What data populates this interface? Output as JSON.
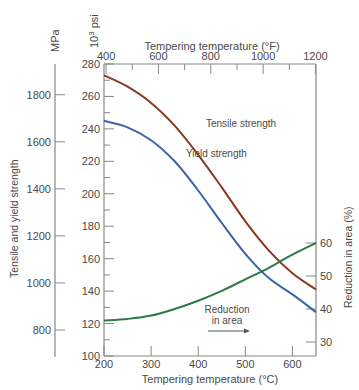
{
  "chart_data": {
    "type": "line",
    "title": "",
    "xlabel": "Tempering temperature (°C)",
    "xlabel_top": "Tempering temperature (°F)",
    "ylabel_left_outer": "Tensile and yield strength",
    "ylabel_left_outer_unit": "MPa",
    "ylabel_left_inner_unit": "10³ psi",
    "ylabel_right": "Reduction in area (%)",
    "xlim": [
      200,
      650
    ],
    "ylim_psi": [
      100,
      280
    ],
    "ylim_mpa": [
      700,
      1900
    ],
    "x_ticks_c": [
      200,
      300,
      400,
      500,
      600
    ],
    "x_ticks_f": [
      400,
      600,
      800,
      1000,
      1200
    ],
    "y_ticks_psi": [
      100,
      120,
      140,
      160,
      180,
      200,
      220,
      240,
      260,
      280
    ],
    "y_ticks_mpa": [
      800,
      1000,
      1200,
      1400,
      1600,
      1800
    ],
    "y_ticks_reduction": [
      30,
      40,
      50,
      60
    ],
    "grid": false,
    "series": [
      {
        "name": "Tensile strength",
        "axis": "psi",
        "color": "#8b3a1e",
        "x": [
          200,
          250,
          300,
          350,
          400,
          450,
          500,
          550,
          600,
          650
        ],
        "values": [
          273,
          266,
          256,
          242,
          224,
          204,
          183,
          165,
          151,
          141
        ]
      },
      {
        "name": "Yield strength",
        "axis": "psi",
        "color": "#3a64a8",
        "x": [
          200,
          250,
          300,
          350,
          400,
          450,
          500,
          550,
          600,
          650
        ],
        "values": [
          245,
          241,
          233,
          220,
          202,
          182,
          163,
          148,
          138,
          127
        ]
      },
      {
        "name": "Reduction in area",
        "axis": "reduction",
        "color": "#2e7a45",
        "x": [
          200,
          250,
          300,
          350,
          400,
          450,
          500,
          550,
          600,
          650
        ],
        "values": [
          36.5,
          37,
          38,
          40,
          42.5,
          45.5,
          49,
          52.5,
          56.5,
          60
        ]
      }
    ],
    "annotations": [
      {
        "text": "Tensile strength",
        "x_c": 420,
        "y_psi": 249
      },
      {
        "text": "Yield strength",
        "x_c": 380,
        "y_psi": 229
      },
      {
        "text": "Reduction",
        "x_c": 455,
        "y_psi": 124
      },
      {
        "text": "in area",
        "x_c": 455,
        "y_psi": 117
      },
      {
        "text": "arrow-right",
        "x_c": 430,
        "y_psi": 111
      }
    ]
  },
  "labels": {
    "mpa": "MPa",
    "psi_base": "10",
    "psi_exp": "3",
    "psi_unit": "psi",
    "top_axis_title": "Tempering temperature (°F)",
    "bottom_axis_title": "Tempering temperature (°C)",
    "left_axis_title": "Tensile and yield strength",
    "right_axis_title": "Reduction in area (%)",
    "tensile_label": "Tensile strength",
    "yield_label": "Yield strength",
    "reduction_label_line1": "Reduction",
    "reduction_label_line2": "in area"
  }
}
